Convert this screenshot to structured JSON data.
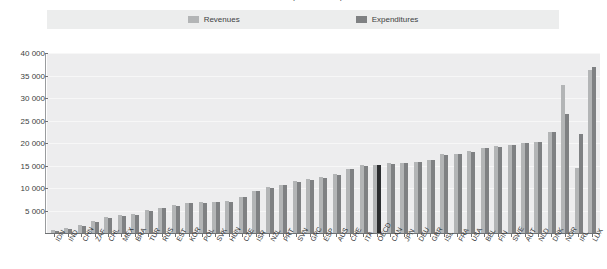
{
  "chart": {
    "title": "Revenues and expenditures per student",
    "legend": {
      "position": "top",
      "items": [
        {
          "label": "Revenues",
          "color": "#b3b5b6"
        },
        {
          "label": "Expenditures",
          "color": "#7f8183"
        }
      ]
    },
    "y_axis": {
      "ticks": [
        "5 000",
        "10 000",
        "15 000",
        "20 000",
        "25 000",
        "30 000",
        "35 000",
        "40 000"
      ],
      "min": 0,
      "max": 40000
    },
    "colors": {
      "revenue": "#b3b5b6",
      "expenditure": "#7f8183",
      "highlight": "#2b2d2f",
      "plot_background": "#ededee",
      "legend_background": "#eceded",
      "gridline": "#f7f7f7",
      "axis": "#6f7173"
    }
  },
  "chart_data": {
    "type": "bar",
    "title": "Revenues and expenditures per student",
    "xlabel": "",
    "ylabel": "",
    "ylim": [
      0,
      40000
    ],
    "grid": true,
    "legend_position": "top",
    "categories": [
      "IDN",
      "IND",
      "CHN",
      "ZAF",
      "CHL",
      "MEX",
      "BRA",
      "TUR",
      "RUS",
      "EST",
      "KOR",
      "POL",
      "SVK",
      "HUN",
      "CZE",
      "ISR",
      "NZL",
      "PRT",
      "SVN",
      "GRC",
      "ESP",
      "AUS",
      "CHE",
      "ITA",
      "OECD",
      "CAN",
      "JPN",
      "DEU",
      "GBR",
      "ISL",
      "FRA",
      "USA",
      "BEL",
      "FIN",
      "SWE",
      "AUT",
      "NLD",
      "DNK",
      "NOR",
      "IRL",
      "LUX"
    ],
    "series": [
      {
        "name": "Revenues",
        "color": "#b3b5b6",
        "values": [
          600,
          1100,
          1800,
          2600,
          3600,
          3900,
          4200,
          5100,
          5600,
          6200,
          6700,
          6800,
          6900,
          7100,
          8000,
          9400,
          10200,
          10700,
          11500,
          11900,
          12400,
          13100,
          14300,
          15100,
          15200,
          15500,
          15600,
          15800,
          16300,
          17500,
          17600,
          18200,
          18900,
          19300,
          19600,
          20100,
          20300,
          22500,
          32800,
          14500,
          36300
        ]
      },
      {
        "name": "Expenditures",
        "color": "#7f8183",
        "values": [
          500,
          900,
          1600,
          2400,
          3400,
          3800,
          4100,
          5000,
          5500,
          6100,
          6600,
          6700,
          6800,
          7000,
          7900,
          9300,
          10100,
          10600,
          11400,
          11800,
          12300,
          13000,
          14200,
          15000,
          15100,
          15400,
          15500,
          15700,
          16200,
          17400,
          17500,
          18100,
          18800,
          19200,
          19500,
          20000,
          20200,
          22400,
          26500,
          22000,
          36800
        ]
      }
    ],
    "highlight_category": "OECD"
  }
}
